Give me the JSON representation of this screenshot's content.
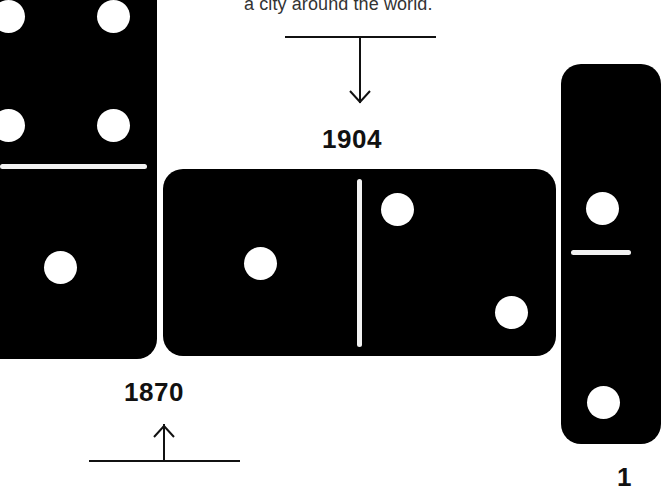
{
  "caption": "a city around the world.",
  "timeline": {
    "markers": [
      {
        "year": "1904",
        "direction": "down"
      },
      {
        "year": "1870",
        "direction": "up"
      }
    ]
  },
  "dominoes": [
    {
      "id": "left-vertical",
      "orientation": "vertical",
      "top_pips": 4,
      "bottom_pips": 1
    },
    {
      "id": "center-horizontal",
      "orientation": "horizontal",
      "left_pips": 1,
      "right_pips": 2
    },
    {
      "id": "right-vertical",
      "orientation": "vertical",
      "top_pips": 1,
      "bottom_pips": 1
    }
  ],
  "colors": {
    "domino": "#000000",
    "pip": "#ffffff",
    "background": "#ffffff",
    "text": "#111111"
  }
}
